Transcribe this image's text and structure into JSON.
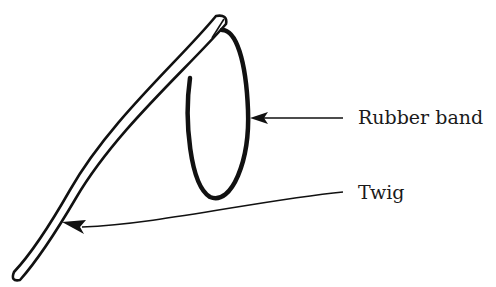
{
  "diagram": {
    "labels": {
      "rubber_band": "Rubber band",
      "twig": "Twig"
    },
    "colors": {
      "ink": "#111111",
      "background": "#ffffff"
    },
    "parts": [
      {
        "name": "twig",
        "description": "curved stick with rounded ends"
      },
      {
        "name": "rubber-band",
        "description": "elliptical loop hooked over top of twig"
      }
    ],
    "callouts": [
      {
        "target": "rubber-band",
        "label_ref": "labels.rubber_band"
      },
      {
        "target": "twig",
        "label_ref": "labels.twig"
      }
    ]
  }
}
